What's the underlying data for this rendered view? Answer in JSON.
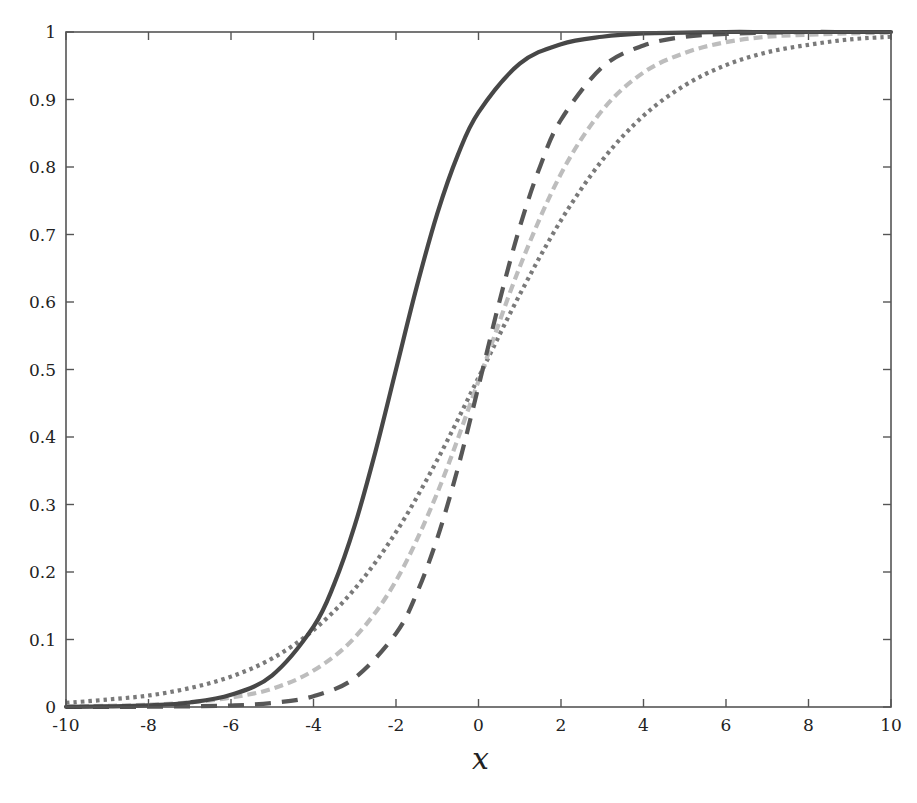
{
  "chart_data": {
    "type": "line",
    "title": "",
    "xlabel": "x",
    "ylabel": "",
    "xlim": [
      -10,
      10
    ],
    "ylim": [
      0,
      1
    ],
    "grid": false,
    "legend": "none",
    "x_ticks": [
      -10,
      -8,
      -6,
      -4,
      -2,
      0,
      2,
      4,
      6,
      8,
      10
    ],
    "x_tick_labels": [
      "-10",
      "-8",
      "-6",
      "-4",
      "-2",
      "0",
      "2",
      "4",
      "6",
      "8",
      "10"
    ],
    "y_ticks": [
      0,
      0.1,
      0.2,
      0.3,
      0.4,
      0.5,
      0.6,
      0.7,
      0.8,
      0.9,
      1
    ],
    "y_tick_labels": [
      "0",
      "0.1",
      "0.2",
      "0.3",
      "0.4",
      "0.5",
      "0.6",
      "0.7",
      "0.8",
      "0.9",
      "1"
    ],
    "series": [
      {
        "name": "solid",
        "style": "solid",
        "color": "#474747",
        "x": [
          -10,
          -9,
          -8,
          -7,
          -6,
          -5,
          -4,
          -3.5,
          -3,
          -2.5,
          -2,
          -1.5,
          -1,
          -0.5,
          0,
          1,
          2,
          3,
          4,
          5,
          6,
          7,
          8,
          9,
          10
        ],
        "values": [
          0.0003,
          0.0009,
          0.0025,
          0.0067,
          0.018,
          0.047,
          0.119,
          0.182,
          0.269,
          0.378,
          0.5,
          0.622,
          0.731,
          0.818,
          0.881,
          0.953,
          0.982,
          0.993,
          0.998,
          0.999,
          1.0,
          1.0,
          1.0,
          1.0,
          1.0
        ]
      },
      {
        "name": "dashed",
        "style": "dashed",
        "color": "#575757",
        "x": [
          -10,
          -9,
          -8,
          -7,
          -6,
          -5,
          -4,
          -3,
          -2,
          -1.5,
          -1,
          -0.5,
          0,
          0.5,
          1,
          1.5,
          2,
          3,
          4,
          5,
          6,
          7,
          8,
          9,
          10
        ],
        "values": [
          0.0,
          0.0001,
          0.0004,
          0.001,
          0.0022,
          0.006,
          0.016,
          0.043,
          0.109,
          0.168,
          0.25,
          0.354,
          0.475,
          0.599,
          0.711,
          0.802,
          0.87,
          0.948,
          0.98,
          0.993,
          0.997,
          0.999,
          1.0,
          1.0,
          1.0
        ]
      },
      {
        "name": "dash-dot-light",
        "style": "short-dashed",
        "color": "#bdbdbd",
        "x": [
          -10,
          -9,
          -8,
          -7,
          -6,
          -5,
          -4,
          -3,
          -2,
          -1,
          0,
          1,
          2,
          3,
          4,
          5,
          6,
          7,
          8,
          9,
          10
        ],
        "values": [
          0.0009,
          0.0017,
          0.0034,
          0.0069,
          0.014,
          0.027,
          0.054,
          0.103,
          0.187,
          0.317,
          0.483,
          0.652,
          0.79,
          0.884,
          0.94,
          0.969,
          0.985,
          0.993,
          0.996,
          0.998,
          0.999
        ]
      },
      {
        "name": "dotted",
        "style": "dotted",
        "color": "#7a7a7a",
        "x": [
          -10,
          -9,
          -8,
          -7,
          -6,
          -5,
          -4,
          -3,
          -2,
          -1,
          0,
          1,
          2,
          3,
          4,
          5,
          6,
          7,
          8,
          9,
          10
        ],
        "values": [
          0.006,
          0.011,
          0.017,
          0.028,
          0.045,
          0.072,
          0.114,
          0.175,
          0.259,
          0.366,
          0.488,
          0.611,
          0.721,
          0.81,
          0.876,
          0.921,
          0.951,
          0.97,
          0.981,
          0.989,
          0.993
        ]
      }
    ]
  }
}
